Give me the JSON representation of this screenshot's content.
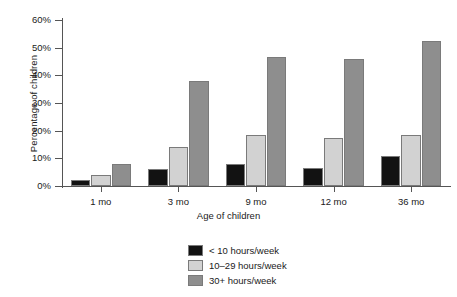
{
  "chart_data": {
    "type": "bar",
    "title": "",
    "subtitle": "",
    "xlabel": "Age of children",
    "ylabel": "Percentage of children",
    "categories": [
      "1 mo",
      "3 mo",
      "9 mo",
      "12 mo",
      "36 mo"
    ],
    "series": [
      {
        "name": "< 10 hours/week",
        "color": "#121212",
        "values": [
          2,
          6,
          8,
          6.5,
          11
        ]
      },
      {
        "name": "10–29 hours/week",
        "color": "#d2d2d2",
        "values": [
          4,
          14,
          18.5,
          17.5,
          18.5
        ]
      },
      {
        "name": "30+ hours/week",
        "color": "#8e8e8e",
        "values": [
          8,
          38,
          46.5,
          46,
          52.5
        ]
      }
    ],
    "ylim": [
      0,
      60
    ],
    "ytick_values": [
      0,
      10,
      20,
      30,
      40,
      50,
      60
    ],
    "ytick_labels": [
      "0%",
      "10%",
      "20%",
      "30%",
      "40%",
      "50%",
      "60%"
    ],
    "grid": false,
    "legend_position": "bottom-center",
    "value_suffix": "%"
  },
  "legend": {
    "entries": [
      {
        "label": "< 10 hours/week",
        "color": "#121212"
      },
      {
        "label": "10–29 hours/week",
        "color": "#d2d2d2"
      },
      {
        "label": "30+ hours/week",
        "color": "#8e8e8e"
      }
    ]
  },
  "axes": {
    "y_title": "Percentage of children",
    "x_title": "Age of children"
  }
}
